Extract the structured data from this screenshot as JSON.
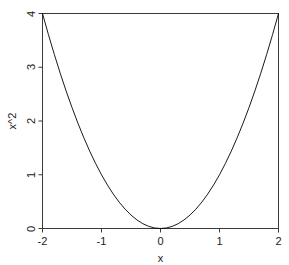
{
  "chart_data": {
    "type": "line",
    "title": "",
    "subtitle": "",
    "xlabel": "x",
    "ylabel": "x^2",
    "xlim": [
      -2,
      2
    ],
    "ylim": [
      0,
      4
    ],
    "grid": false,
    "legend": null,
    "legend_position": "none",
    "box": true,
    "line_color": "#000000",
    "background_color": "#ffffff",
    "axis_color": "#3a3a3a",
    "xticks": [
      {
        "value": -2,
        "label": "-2"
      },
      {
        "value": -1,
        "label": "-1"
      },
      {
        "value": 0,
        "label": "0"
      },
      {
        "value": 1,
        "label": "1"
      },
      {
        "value": 2,
        "label": "2"
      }
    ],
    "yticks": [
      {
        "value": 0,
        "label": "0"
      },
      {
        "value": 1,
        "label": "1"
      },
      {
        "value": 2,
        "label": "2"
      },
      {
        "value": 3,
        "label": "3"
      },
      {
        "value": 4,
        "label": "4"
      }
    ],
    "series": [
      {
        "name": "x^2",
        "x": [
          -2,
          -1.9,
          -1.8,
          -1.7,
          -1.6,
          -1.5,
          -1.4,
          -1.3,
          -1.2,
          -1.1,
          -1,
          -0.9,
          -0.8,
          -0.7,
          -0.6,
          -0.5,
          -0.4,
          -0.3,
          -0.2,
          -0.1,
          0,
          0.1,
          0.2,
          0.3,
          0.4,
          0.5,
          0.6,
          0.7,
          0.8,
          0.9,
          1,
          1.1,
          1.2,
          1.3,
          1.4,
          1.5,
          1.6,
          1.7,
          1.8,
          1.9,
          2
        ],
        "values": [
          4,
          3.61,
          3.24,
          2.89,
          2.56,
          2.25,
          1.96,
          1.69,
          1.44,
          1.21,
          1,
          0.81,
          0.64,
          0.49,
          0.36,
          0.25,
          0.16,
          0.09,
          0.04,
          0.01,
          0,
          0.01,
          0.04,
          0.09,
          0.16,
          0.25,
          0.36,
          0.49,
          0.64,
          0.81,
          1,
          1.21,
          1.44,
          1.69,
          1.96,
          2.25,
          2.56,
          2.89,
          3.24,
          3.61,
          4
        ]
      }
    ]
  },
  "plot": {
    "x_axis_title": "x",
    "y_axis_title": "x^2"
  }
}
